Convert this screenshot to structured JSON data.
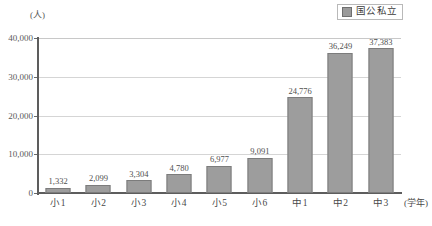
{
  "chart_data": {
    "type": "bar",
    "title": "",
    "xlabel": "(学年)",
    "ylabel": "(人)",
    "categories": [
      "小1",
      "小2",
      "小3",
      "小4",
      "小5",
      "小6",
      "中1",
      "中2",
      "中3"
    ],
    "values": [
      1332,
      2099,
      3304,
      4780,
      6977,
      9091,
      24776,
      36249,
      37383
    ],
    "value_labels": [
      "1,332",
      "2,099",
      "3,304",
      "4,780",
      "6,977",
      "9,091",
      "24,776",
      "36,249",
      "37,383"
    ],
    "ylim": [
      0,
      40000
    ],
    "yticks": [
      0,
      10000,
      20000,
      30000,
      40000
    ],
    "ytick_labels": [
      "0",
      "10,000",
      "20,000",
      "30,000",
      "40,000"
    ],
    "grid": true,
    "legend": {
      "position": "top-right",
      "entries": [
        {
          "label": "国公私立",
          "color": "#9d9d9d"
        }
      ]
    },
    "series": [
      {
        "name": "国公私立",
        "color": "#9d9d9d",
        "values": [
          1332,
          2099,
          3304,
          4780,
          6977,
          9091,
          24776,
          36249,
          37383
        ]
      }
    ]
  },
  "colors": {
    "bar_fill": "#9d9d9d",
    "bar_border": "#7c7c7c",
    "gridline": "#d5d5d5",
    "axis": "#5d5d5d",
    "background": "#ffffff",
    "text": "#4a4a4a"
  }
}
